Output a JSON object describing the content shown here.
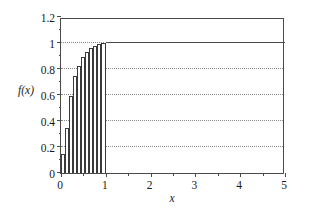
{
  "chart_data": {
    "type": "bar",
    "title": "",
    "xlabel": "x",
    "ylabel": "f(x)",
    "xlim": [
      0,
      5
    ],
    "ylim": [
      0,
      1.2
    ],
    "grid": true,
    "grid_axis": "y",
    "grid_style": "dotted",
    "legend": null,
    "xticks": [
      0,
      1,
      2,
      3,
      4,
      5
    ],
    "xtick_labels": [
      "0",
      "1",
      "2",
      "3",
      "4",
      "5"
    ],
    "yticks": [
      0,
      0.2,
      0.4,
      0.6,
      0.8,
      1,
      1.2
    ],
    "ytick_labels": [
      "0",
      "0.2",
      "0.4",
      "0.6",
      "0.8",
      "1",
      "1.2"
    ],
    "ygridlines": [
      0.2,
      0.4,
      0.6,
      0.8,
      1
    ],
    "xminor_ticks": [
      0.5,
      1.5,
      2.5,
      3.5,
      4.5
    ],
    "yminor_ticks": [
      0.1,
      0.3,
      0.5,
      0.7,
      0.9,
      1.1
    ],
    "bar_x_left": [
      0.0,
      0.09,
      0.18,
      0.27,
      0.36,
      0.45,
      0.54,
      0.63,
      0.72,
      0.81,
      0.9
    ],
    "bar_x_right": [
      0.09,
      0.18,
      0.27,
      0.36,
      0.45,
      0.54,
      0.63,
      0.72,
      0.81,
      0.9,
      1.0
    ],
    "values": [
      0.15,
      0.35,
      0.59,
      0.75,
      0.82,
      0.89,
      0.93,
      0.96,
      0.98,
      0.99,
      1.0
    ],
    "categories": [
      "0.00-0.09",
      "0.09-0.18",
      "0.18-0.27",
      "0.27-0.36",
      "0.36-0.45",
      "0.45-0.54",
      "0.54-0.63",
      "0.63-0.72",
      "0.72-0.81",
      "0.81-0.90",
      "0.90-1.00"
    ],
    "tail_segment": {
      "x_start": 1.0,
      "x_end": 5.0,
      "y": 1.0
    },
    "series": [
      {
        "name": "f(x)",
        "values": [
          0.15,
          0.35,
          0.59,
          0.75,
          0.82,
          0.89,
          0.93,
          0.96,
          0.98,
          0.99,
          1.0
        ]
      }
    ],
    "colors": {
      "bar_edge": "#3a3a3a",
      "bar_fill": "#ffffff",
      "axis": "#4a4a4a",
      "grid": "#8a8a8a",
      "tail_line": "#4a4a4a"
    }
  }
}
